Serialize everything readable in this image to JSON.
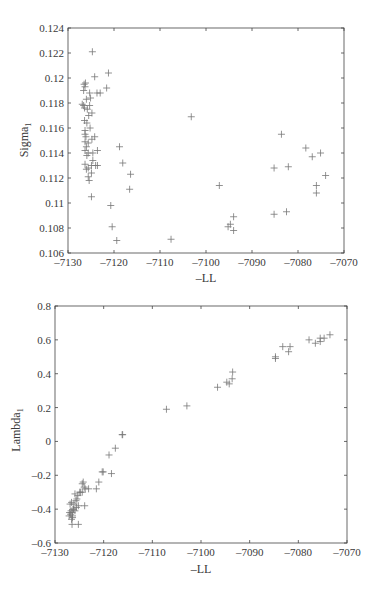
{
  "chart_data": [
    {
      "type": "scatter",
      "title": "",
      "xlabel": "–LL",
      "ylabel": "Sigma",
      "ylabel_subscript": "1",
      "xlim": [
        -7130,
        -7070
      ],
      "ylim": [
        0.106,
        0.124
      ],
      "xticks": [
        "–7130",
        "–7120",
        "–7110",
        "–7100",
        "–7090",
        "–7080",
        "–7070"
      ],
      "xtick_values": [
        -7130,
        -7120,
        -7110,
        -7100,
        -7090,
        -7080,
        -7070
      ],
      "yticks": [
        "0.106",
        "0.108",
        "0.11",
        "0.112",
        "0.114",
        "0.116",
        "0.118",
        "0.12",
        "0.122",
        "0.124"
      ],
      "ytick_values": [
        0.106,
        0.108,
        0.11,
        0.112,
        0.114,
        0.116,
        0.118,
        0.12,
        0.122,
        0.124
      ],
      "grid": false,
      "marker": "+",
      "points": [
        [
          -7124.7,
          0.1221
        ],
        [
          -7124.2,
          0.1201
        ],
        [
          -7121.2,
          0.1204
        ],
        [
          -7121.6,
          0.1192
        ],
        [
          -7125.3,
          0.1188
        ],
        [
          -7123.7,
          0.1188
        ],
        [
          -7123.0,
          0.1188
        ],
        [
          -7126.5,
          0.1195
        ],
        [
          -7126.3,
          0.1193
        ],
        [
          -7126.6,
          0.119
        ],
        [
          -7126.2,
          0.1196
        ],
        [
          -7125.1,
          0.1184
        ],
        [
          -7126.0,
          0.1183
        ],
        [
          -7126.9,
          0.1179
        ],
        [
          -7126.6,
          0.1178
        ],
        [
          -7125.3,
          0.1178
        ],
        [
          -7125.8,
          0.1175
        ],
        [
          -7126.4,
          0.1176
        ],
        [
          -7124.8,
          0.1172
        ],
        [
          -7125.5,
          0.117
        ],
        [
          -7126.4,
          0.1166
        ],
        [
          -7125.9,
          0.1164
        ],
        [
          -7125.2,
          0.116
        ],
        [
          -7126.3,
          0.1158
        ],
        [
          -7126.3,
          0.1155
        ],
        [
          -7126.1,
          0.1153
        ],
        [
          -7124.2,
          0.1153
        ],
        [
          -7124.8,
          0.1151
        ],
        [
          -7126.3,
          0.1149
        ],
        [
          -7125.6,
          0.1148
        ],
        [
          -7126.0,
          0.1145
        ],
        [
          -7126.3,
          0.1142
        ],
        [
          -7123.6,
          0.1142
        ],
        [
          -7125.6,
          0.114
        ],
        [
          -7124.6,
          0.114
        ],
        [
          -7125.9,
          0.1138
        ],
        [
          -7124.6,
          0.1134
        ],
        [
          -7126.3,
          0.1131
        ],
        [
          -7124.9,
          0.113
        ],
        [
          -7124.0,
          0.113
        ],
        [
          -7123.6,
          0.113
        ],
        [
          -7125.6,
          0.1128
        ],
        [
          -7126.0,
          0.1127
        ],
        [
          -7124.9,
          0.1124
        ],
        [
          -7125.6,
          0.1121
        ],
        [
          -7125.4,
          0.1118
        ],
        [
          -7124.9,
          0.1105
        ],
        [
          -7118.8,
          0.1145
        ],
        [
          -7118.1,
          0.1132
        ],
        [
          -7116.4,
          0.1123
        ],
        [
          -7116.6,
          0.1111
        ],
        [
          -7120.7,
          0.1098
        ],
        [
          -7120.4,
          0.1081
        ],
        [
          -7119.4,
          0.107
        ],
        [
          -7107.6,
          0.1071
        ],
        [
          -7103.2,
          0.1169
        ],
        [
          -7097.1,
          0.1114
        ],
        [
          -7094.0,
          0.1089
        ],
        [
          -7094.7,
          0.1083
        ],
        [
          -7095.2,
          0.1081
        ],
        [
          -7094.0,
          0.1078
        ],
        [
          -7085.2,
          0.1128
        ],
        [
          -7085.2,
          0.1091
        ],
        [
          -7083.6,
          0.1155
        ],
        [
          -7082.1,
          0.1129
        ],
        [
          -7082.5,
          0.1093
        ],
        [
          -7078.3,
          0.1144
        ],
        [
          -7076.9,
          0.1137
        ],
        [
          -7075.1,
          0.114
        ],
        [
          -7074.0,
          0.1122
        ],
        [
          -7076.0,
          0.1114
        ],
        [
          -7076.0,
          0.1108
        ]
      ]
    },
    {
      "type": "scatter",
      "title": "",
      "xlabel": "–LL",
      "ylabel": "Lambda",
      "ylabel_subscript": "1",
      "xlim": [
        -7130,
        -7070
      ],
      "ylim": [
        -0.6,
        0.8
      ],
      "xticks": [
        "–7130",
        "–7120",
        "–7110",
        "–7100",
        "–7090",
        "–7080",
        "–7070"
      ],
      "xtick_values": [
        -7130,
        -7120,
        -7110,
        -7100,
        -7090,
        -7080,
        -7070
      ],
      "yticks": [
        "–0.6",
        "–0.4",
        "–0.2",
        "0",
        "0.2",
        "0.4",
        "0.6",
        "0.8"
      ],
      "ytick_values": [
        -0.6,
        -0.4,
        -0.2,
        0,
        0.2,
        0.4,
        0.6,
        0.8
      ],
      "grid": false,
      "marker": "+",
      "points": [
        [
          -7073.5,
          0.63
        ],
        [
          -7074.7,
          0.61
        ],
        [
          -7075.5,
          0.61
        ],
        [
          -7075.5,
          0.59
        ],
        [
          -7076.5,
          0.58
        ],
        [
          -7077.8,
          0.6
        ],
        [
          -7081.7,
          0.56
        ],
        [
          -7083.2,
          0.56
        ],
        [
          -7082.0,
          0.53
        ],
        [
          -7084.7,
          0.5
        ],
        [
          -7084.7,
          0.49
        ],
        [
          -7093.5,
          0.41
        ],
        [
          -7093.6,
          0.37
        ],
        [
          -7094.2,
          0.34
        ],
        [
          -7094.7,
          0.35
        ],
        [
          -7096.6,
          0.32
        ],
        [
          -7102.9,
          0.21
        ],
        [
          -7107.1,
          0.19
        ],
        [
          -7116.1,
          0.04
        ],
        [
          -7116.2,
          0.04
        ],
        [
          -7117.6,
          -0.04
        ],
        [
          -7118.9,
          -0.08
        ],
        [
          -7118.4,
          -0.19
        ],
        [
          -7120.1,
          -0.18
        ],
        [
          -7120.3,
          -0.18
        ],
        [
          -7121.0,
          -0.24
        ],
        [
          -7121.5,
          -0.28
        ],
        [
          -7123.1,
          -0.28
        ],
        [
          -7124.2,
          -0.24
        ],
        [
          -7124.4,
          -0.25
        ],
        [
          -7124.0,
          -0.27
        ],
        [
          -7123.8,
          -0.28
        ],
        [
          -7124.8,
          -0.3
        ],
        [
          -7124.9,
          -0.3
        ],
        [
          -7124.4,
          -0.3
        ],
        [
          -7123.9,
          -0.38
        ],
        [
          -7125.3,
          -0.32
        ],
        [
          -7125.5,
          -0.34
        ],
        [
          -7125.9,
          -0.31
        ],
        [
          -7125.7,
          -0.35
        ],
        [
          -7126.1,
          -0.37
        ],
        [
          -7126.6,
          -0.36
        ],
        [
          -7126.9,
          -0.37
        ],
        [
          -7125.2,
          -0.38
        ],
        [
          -7125.6,
          -0.39
        ],
        [
          -7126.3,
          -0.4
        ],
        [
          -7125.9,
          -0.41
        ],
        [
          -7126.7,
          -0.41
        ],
        [
          -7127.0,
          -0.42
        ],
        [
          -7126.5,
          -0.42
        ],
        [
          -7126.4,
          -0.44
        ],
        [
          -7126.8,
          -0.43
        ],
        [
          -7127.1,
          -0.44
        ],
        [
          -7126.4,
          -0.45
        ],
        [
          -7126.6,
          -0.46
        ],
        [
          -7126.2,
          -0.4
        ],
        [
          -7126.5,
          -0.49
        ],
        [
          -7125.2,
          -0.49
        ]
      ]
    }
  ]
}
